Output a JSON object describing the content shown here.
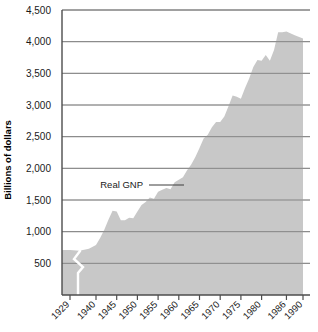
{
  "chart_data": {
    "type": "area",
    "title": "",
    "xlabel": "",
    "ylabel": "Billions of dollars",
    "ylim": [
      0,
      4500
    ],
    "grid": true,
    "legend_position": "inline-annotation",
    "series_name": "Real GNP",
    "annotation": "Real GNP",
    "axis_break": "1929-1940",
    "fill_color": "#c8c8c8",
    "gridline_color": "#808080",
    "axis_color": "#4d4d4d",
    "background_color": "#ffffff",
    "ytick_labels": [
      "500",
      "1,000",
      "1,500",
      "2,000",
      "2,500",
      "3,000",
      "3,500",
      "4,000",
      "4,500"
    ],
    "ytick_values": [
      500,
      1000,
      1500,
      2000,
      2500,
      3000,
      3500,
      4000,
      4500
    ],
    "xtick_labels": [
      "1929",
      "1940",
      "1945",
      "1950",
      "1955",
      "1960",
      "1965",
      "1970",
      "1975",
      "1980",
      "1986",
      "1990"
    ],
    "xtick_values": [
      1929,
      1940,
      1945,
      1950,
      1955,
      1960,
      1965,
      1970,
      1975,
      1980,
      1986,
      1990
    ],
    "x": [
      1929,
      1933,
      1937,
      1940,
      1941,
      1942,
      1943,
      1944,
      1945,
      1946,
      1947,
      1948,
      1949,
      1950,
      1951,
      1952,
      1953,
      1954,
      1955,
      1956,
      1957,
      1958,
      1959,
      1960,
      1961,
      1962,
      1963,
      1964,
      1965,
      1966,
      1967,
      1968,
      1969,
      1970,
      1971,
      1972,
      1973,
      1974,
      1975,
      1976,
      1977,
      1978,
      1979,
      1980,
      1981,
      1982,
      1983,
      1984,
      1985,
      1986,
      1988,
      1990
    ],
    "values": [
      710,
      700,
      730,
      790,
      900,
      1030,
      1190,
      1330,
      1320,
      1180,
      1180,
      1220,
      1210,
      1320,
      1420,
      1470,
      1540,
      1520,
      1630,
      1660,
      1690,
      1670,
      1780,
      1820,
      1860,
      1970,
      2060,
      2180,
      2320,
      2470,
      2530,
      2650,
      2730,
      2730,
      2820,
      2980,
      3150,
      3130,
      3100,
      3270,
      3420,
      3600,
      3710,
      3700,
      3790,
      3700,
      3870,
      4150,
      4150,
      4160,
      4100,
      4050
    ]
  }
}
